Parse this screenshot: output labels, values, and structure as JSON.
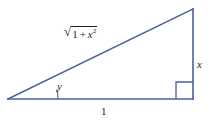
{
  "figure": {
    "kind": "right-triangle-diagram",
    "background_color": "#ffffff",
    "stroke_color": "#4a5f9e",
    "text_color": "#231f20",
    "canvas": {
      "width": 211,
      "height": 123
    }
  },
  "triangle": {
    "vertices": {
      "left": {
        "x": 8,
        "y": 99
      },
      "top_right": {
        "x": 193,
        "y": 9
      },
      "bottom_right": {
        "x": 193,
        "y": 99
      }
    },
    "right_angle_marker": {
      "at": "bottom_right",
      "size": 17
    },
    "angle_arc": {
      "at": "left",
      "radius": 50
    }
  },
  "labels": {
    "hypotenuse": {
      "text": "√(1 + x²)",
      "radical_symbol": "√",
      "radicand_first": "1",
      "operator": "+",
      "radicand_variable": "x",
      "radicand_exponent": "2"
    },
    "angle": {
      "text": "y"
    },
    "vertical_leg": {
      "text": "x"
    },
    "base_leg": {
      "text": "1"
    }
  }
}
